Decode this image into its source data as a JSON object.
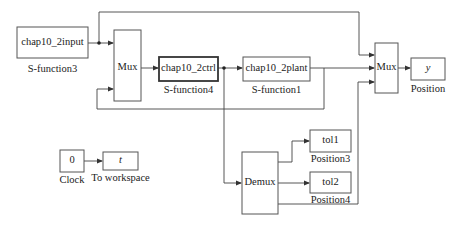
{
  "diagram": {
    "type": "simulink-block-diagram",
    "blocks": [
      {
        "id": "sfun3",
        "text": "chap10_2input",
        "label": "S-function3"
      },
      {
        "id": "mux1",
        "text": "Mux",
        "label": ""
      },
      {
        "id": "sfun4",
        "text": "chap10_2ctrl",
        "label": "S-function4"
      },
      {
        "id": "sfun1",
        "text": "chap10_2plant",
        "label": "S-function1"
      },
      {
        "id": "mux2",
        "text": "Mux",
        "label": ""
      },
      {
        "id": "out_y",
        "text": "y",
        "label": "Position"
      },
      {
        "id": "clock",
        "text": "0",
        "label": "Clock"
      },
      {
        "id": "toworkspace",
        "text": "t",
        "label": "To workspace"
      },
      {
        "id": "demux",
        "text": "Demux",
        "label": ""
      },
      {
        "id": "tol1",
        "text": "tol1",
        "label": "Position3"
      },
      {
        "id": "tol2",
        "text": "tol2",
        "label": "Position4"
      }
    ],
    "connections": [
      {
        "from": "sfun3",
        "to": "mux1",
        "port": 1
      },
      {
        "from": "sfun3",
        "to": "mux2",
        "port": 1
      },
      {
        "from": "mux1",
        "to": "sfun4",
        "port": 1
      },
      {
        "from": "sfun4",
        "to": "sfun1",
        "port": 1
      },
      {
        "from": "sfun4",
        "to": "demux",
        "port": 1
      },
      {
        "from": "sfun1",
        "to": "mux2",
        "port": 2
      },
      {
        "from": "sfun1",
        "to": "mux1",
        "port": 2
      },
      {
        "from": "mux2",
        "to": "out_y",
        "port": 1
      },
      {
        "from": "clock",
        "to": "toworkspace",
        "port": 1
      },
      {
        "from": "demux",
        "to": "tol1",
        "port": 1
      },
      {
        "from": "demux",
        "to": "tol2",
        "port": 1
      },
      {
        "from": "demux",
        "to": "mux2",
        "port": 3
      }
    ]
  }
}
